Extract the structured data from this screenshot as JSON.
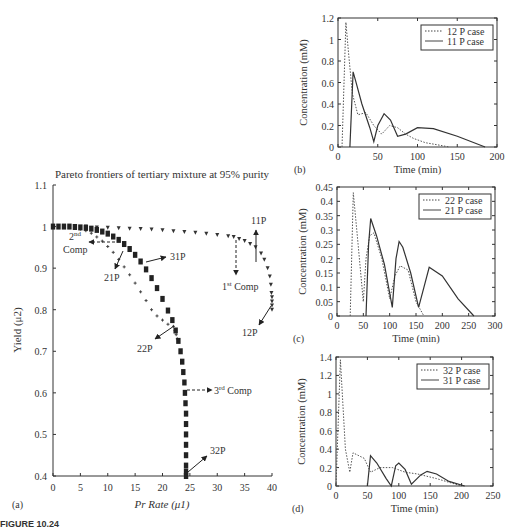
{
  "caption": "FIGURE 10.24",
  "chart_data": [
    {
      "panel": "(a)",
      "type": "scatter",
      "title": "Pareto frontiers of tertiary mixture at 95% purity",
      "xlabel": "Pr Rate (μ1)",
      "ylabel": "Yield (μ2)",
      "xlim": [
        0,
        40
      ],
      "ylim": [
        0.4,
        1.1
      ],
      "xticks": [
        "0",
        "5",
        "10",
        "15",
        "20",
        "25",
        "30",
        "35",
        "40"
      ],
      "yticks": [
        "0.4",
        "0.5",
        "0.6",
        "0.7",
        "0.8",
        "0.9",
        "1",
        "1.1"
      ],
      "series": [
        {
          "name": "1st Comp",
          "marker": "triangle-down",
          "x": [
            0,
            2,
            4,
            6,
            8,
            10,
            12,
            14,
            16,
            18,
            20,
            22,
            24,
            26,
            28,
            30,
            32,
            33,
            34,
            35,
            36,
            37,
            38,
            38.6,
            39.2,
            39.6,
            39.8,
            39.9,
            40,
            40,
            40,
            40
          ],
          "y": [
            1.0,
            1.0,
            1.0,
            1.0,
            0.998,
            0.997,
            0.996,
            0.995,
            0.994,
            0.993,
            0.991,
            0.989,
            0.987,
            0.985,
            0.983,
            0.98,
            0.977,
            0.975,
            0.97,
            0.965,
            0.958,
            0.95,
            0.935,
            0.92,
            0.9,
            0.88,
            0.86,
            0.84,
            0.83,
            0.82,
            0.81,
            0.8
          ]
        },
        {
          "name": "2nd Comp",
          "marker": "plus",
          "x": [
            0,
            1,
            2,
            3,
            4,
            5,
            6,
            7,
            8,
            9,
            10,
            11,
            12,
            13,
            14,
            15,
            16,
            17,
            18,
            19,
            20,
            21,
            22,
            22.3,
            22.5,
            22.7
          ],
          "y": [
            1.0,
            1.0,
            1.0,
            0.999,
            0.997,
            0.994,
            0.99,
            0.984,
            0.975,
            0.965,
            0.952,
            0.938,
            0.921,
            0.903,
            0.884,
            0.864,
            0.843,
            0.822,
            0.8,
            0.785,
            0.775,
            0.765,
            0.76,
            0.75,
            0.74,
            0.73
          ]
        },
        {
          "name": "3rd Comp",
          "marker": "square",
          "x": [
            0,
            1,
            2,
            3,
            4,
            5,
            6,
            7,
            8,
            9,
            10,
            11,
            12,
            13,
            14,
            15,
            16,
            17,
            18,
            19,
            20,
            21,
            21.8,
            22.4,
            22.9,
            23.3,
            23.6,
            23.8,
            24,
            24.1,
            24.2,
            24.3,
            24.3,
            24.3,
            24.3,
            24.3,
            24.3,
            24.3,
            24.3
          ],
          "y": [
            1.0,
            1.0,
            1.0,
            1.0,
            0.999,
            0.998,
            0.997,
            0.995,
            0.992,
            0.988,
            0.983,
            0.976,
            0.968,
            0.958,
            0.946,
            0.932,
            0.916,
            0.897,
            0.876,
            0.852,
            0.826,
            0.798,
            0.775,
            0.75,
            0.725,
            0.7,
            0.675,
            0.65,
            0.625,
            0.6,
            0.575,
            0.55,
            0.525,
            0.5,
            0.475,
            0.45,
            0.425,
            0.41,
            0.4
          ]
        }
      ],
      "annotations": [
        {
          "text": "11P",
          "x": 38.5,
          "y": 1.03
        },
        {
          "text": "1st Comp",
          "x": 34.5,
          "y": 0.885
        },
        {
          "text": "12P",
          "x": 38.5,
          "y": 0.765
        },
        {
          "text": "2nd Comp",
          "x": 4.5,
          "y": 0.925
        },
        {
          "text": "31P",
          "x": 23,
          "y": 0.93
        },
        {
          "text": "21P",
          "x": 11,
          "y": 0.885
        },
        {
          "text": "22P",
          "x": 16,
          "y": 0.7
        },
        {
          "text": "3rd Comp",
          "x": 29.5,
          "y": 0.61
        },
        {
          "text": "32P",
          "x": 29.5,
          "y": 0.45
        }
      ]
    },
    {
      "panel": "(b)",
      "type": "line",
      "xlabel": "Time (min)",
      "ylabel": "Concentration (mM)",
      "xlim": [
        0,
        200
      ],
      "ylim": [
        0,
        1.2
      ],
      "xticks": [
        "0",
        "50",
        "100",
        "150",
        "200"
      ],
      "yticks": [
        "0",
        "0.2",
        "0.4",
        "0.6",
        "0.8",
        "1",
        "1.2"
      ],
      "legend": [
        "12 P case",
        "11 P case"
      ],
      "legend_position": "upper right",
      "series": [
        {
          "name": "12 P case",
          "style": "dotted",
          "x": [
            5,
            10,
            13,
            18,
            25,
            35,
            45,
            55,
            65,
            75,
            85,
            95,
            110,
            125,
            140
          ],
          "y": [
            0,
            1.16,
            0.9,
            0.5,
            0.3,
            0.32,
            0.2,
            0.12,
            0.2,
            0.18,
            0.12,
            0.08,
            0.04,
            0.02,
            0
          ]
        },
        {
          "name": "11 P case",
          "style": "solid",
          "x": [
            15,
            19,
            22,
            30,
            40,
            45,
            50,
            58,
            66,
            75,
            85,
            100,
            120,
            150,
            185
          ],
          "y": [
            0,
            0.7,
            0.62,
            0.4,
            0.18,
            0.05,
            0.2,
            0.31,
            0.25,
            0.1,
            0.12,
            0.18,
            0.17,
            0.1,
            0
          ]
        }
      ]
    },
    {
      "panel": "(c)",
      "type": "line",
      "xlabel": "Time (min)",
      "ylabel": "Concentration (mM)",
      "xlim": [
        0,
        300
      ],
      "ylim": [
        0,
        0.45
      ],
      "xticks": [
        "0",
        "50",
        "100",
        "150",
        "200",
        "250",
        "300"
      ],
      "yticks": [
        "0",
        "0.05",
        "0.1",
        "0.15",
        "0.2",
        "0.25",
        "0.3",
        "0.35",
        "0.4",
        "0.45"
      ],
      "legend": [
        "22 P case",
        "21 P case"
      ],
      "legend_position": "upper right",
      "series": [
        {
          "name": "22 P case",
          "style": "dotted",
          "x": [
            25,
            31,
            40,
            50,
            55,
            62,
            70,
            85,
            100,
            110,
            120,
            135,
            150,
            165
          ],
          "y": [
            0,
            0.43,
            0.25,
            0.05,
            0.2,
            0.28,
            0.29,
            0.2,
            0.06,
            0.14,
            0.175,
            0.16,
            0.05,
            0
          ]
        },
        {
          "name": "21 P case",
          "style": "solid",
          "x": [
            55,
            60,
            64,
            75,
            90,
            105,
            112,
            118,
            125,
            140,
            155,
            165,
            175,
            200,
            230,
            260
          ],
          "y": [
            0,
            0.25,
            0.34,
            0.28,
            0.18,
            0.03,
            0.2,
            0.26,
            0.24,
            0.15,
            0.03,
            0.1,
            0.17,
            0.14,
            0.06,
            0
          ]
        }
      ]
    },
    {
      "panel": "(d)",
      "type": "line",
      "xlabel": "Time (min)",
      "ylabel": "Concentration (mM)",
      "xlim": [
        0,
        250
      ],
      "ylim": [
        0,
        1.4
      ],
      "xticks": [
        "0",
        "50",
        "100",
        "150",
        "200",
        "250"
      ],
      "yticks": [
        "0",
        "0.2",
        "0.4",
        "0.6",
        "0.8",
        "1",
        "1.2",
        "1.4"
      ],
      "legend": [
        "32 P case",
        "31 P case"
      ],
      "legend_position": "upper right",
      "series": [
        {
          "name": "32 P case",
          "style": "dotted",
          "x": [
            0,
            7,
            15,
            22,
            27,
            45,
            55,
            70,
            90,
            110,
            130,
            160,
            200
          ],
          "y": [
            0,
            1.37,
            0.4,
            0.15,
            0.36,
            0.3,
            0.15,
            0.2,
            0.2,
            0.15,
            0.13,
            0.08,
            0
          ]
        },
        {
          "name": "31 P case",
          "style": "solid",
          "x": [
            50,
            55,
            65,
            80,
            88,
            95,
            100,
            110,
            120,
            135,
            145,
            160,
            180,
            205
          ],
          "y": [
            0,
            0.33,
            0.25,
            0.08,
            0,
            0.22,
            0.25,
            0.18,
            0.02,
            0.12,
            0.16,
            0.13,
            0.05,
            0
          ]
        }
      ]
    }
  ]
}
